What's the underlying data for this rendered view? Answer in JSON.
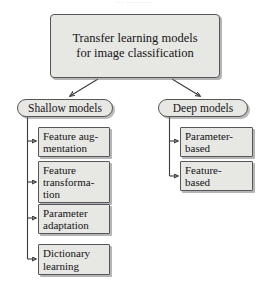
{
  "figure": {
    "top_caption": "...  ..........",
    "root": {
      "label": "Transfer learning models\nfor image classification"
    },
    "branches": [
      {
        "id": "shallow",
        "label": "Shallow models",
        "children": [
          {
            "id": "feature-augmentation",
            "label": "Feature aug-\nmentation"
          },
          {
            "id": "feature-transformation",
            "label": "Feature\ntransforma-\ntion"
          },
          {
            "id": "parameter-adaptation",
            "label": "Parameter\nadaptation"
          },
          {
            "id": "dictionary-learning",
            "label": "Dictionary\nlearning"
          }
        ]
      },
      {
        "id": "deep",
        "label": "Deep models",
        "children": [
          {
            "id": "parameter-based",
            "label": "Parameter-\nbased"
          },
          {
            "id": "feature-based",
            "label": "Feature-\nbased"
          }
        ]
      }
    ],
    "colors": {
      "node_fill": "#e7e7e4",
      "node_border": "#56565a",
      "connector": "#3b3b3b",
      "shadow": "#78787a",
      "background": "#ffffff",
      "text": "#141414"
    }
  }
}
